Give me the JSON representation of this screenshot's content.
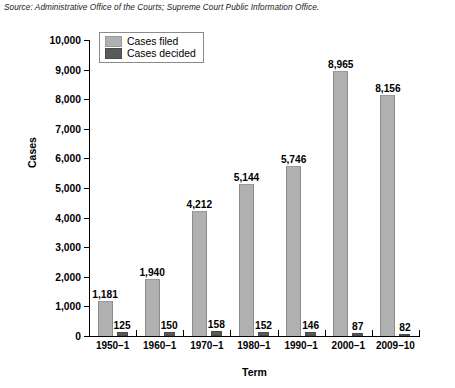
{
  "source_note": "Source: Administrative Office of the Courts; Supreme Court Public Information Office.",
  "legend": {
    "items": [
      {
        "label": "Cases filed",
        "color": "#b0b0b0",
        "swatch": "filed-swatch"
      },
      {
        "label": "Cases decided",
        "color": "#5a5a5a",
        "swatch": "decided-swatch"
      }
    ]
  },
  "chart_data": {
    "type": "bar",
    "title": "",
    "xlabel": "Term",
    "ylabel": "Cases",
    "categories": [
      "1950–1",
      "1960–1",
      "1970–1",
      "1980–1",
      "1990–1",
      "2000–1",
      "2009–10"
    ],
    "series": [
      {
        "name": "Cases filed",
        "color": "#b0b0b0",
        "values": [
          1181,
          1940,
          4212,
          5144,
          5746,
          8965,
          8156
        ],
        "labels": [
          "1,181",
          "1,940",
          "4,212",
          "5,144",
          "5,746",
          "8,965",
          "8,156"
        ]
      },
      {
        "name": "Cases decided",
        "color": "#5a5a5a",
        "values": [
          125,
          150,
          158,
          152,
          146,
          87,
          82
        ],
        "labels": [
          "125",
          "150",
          "158",
          "152",
          "146",
          "87",
          "82"
        ]
      }
    ],
    "ylim": [
      0,
      10000
    ],
    "yticks": [
      0,
      1000,
      2000,
      3000,
      4000,
      5000,
      6000,
      7000,
      8000,
      9000,
      10000
    ],
    "ytick_labels": [
      "0",
      "1,000",
      "2,000",
      "3,000",
      "4,000",
      "5,000",
      "6,000",
      "7,000",
      "8,000",
      "9,000",
      "10,000"
    ],
    "grid": false,
    "legend_position": "top-left-inside"
  }
}
